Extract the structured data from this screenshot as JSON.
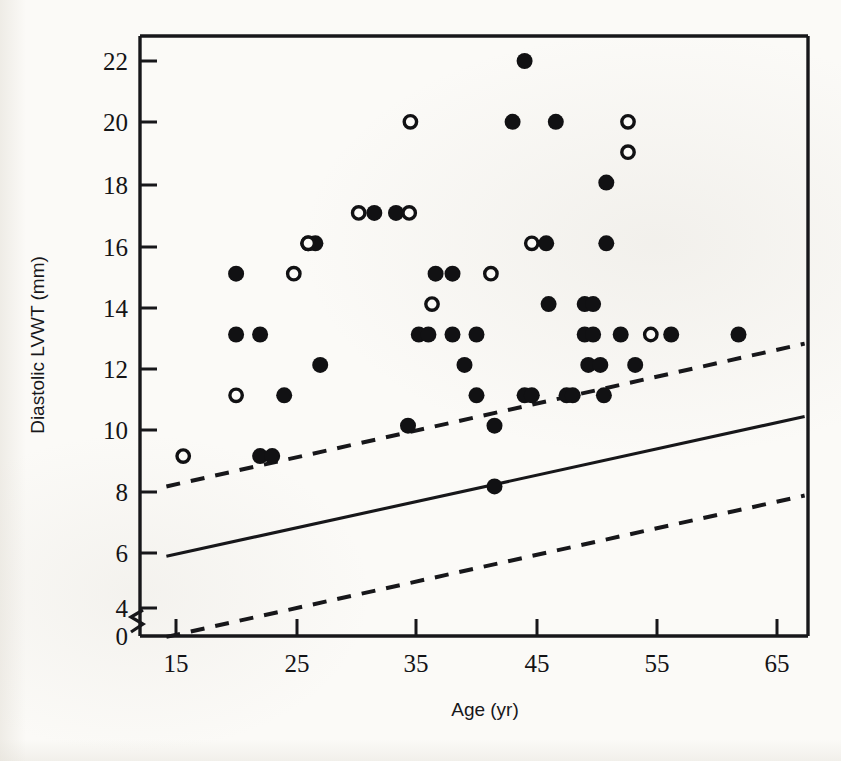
{
  "figure": {
    "background_color": "#fbfaf7",
    "ink_color": "#17171a"
  },
  "axes": {
    "x_label": "Age (yr)",
    "y_label": "Diastolic LVWT (mm)",
    "x_ticks": [
      "15",
      "25",
      "35",
      "45",
      "55",
      "65"
    ],
    "y_ticks": [
      "0",
      "4",
      "6",
      "8",
      "10",
      "12",
      "14",
      "16",
      "18",
      "20",
      "22"
    ],
    "y_axis_break": true
  },
  "chart_data": {
    "type": "scatter",
    "title": "",
    "xlabel": "Age (yr)",
    "ylabel": "Diastolic LVWT (mm)",
    "xlim": [
      13.5,
      67.5
    ],
    "ylim": [
      3.6,
      22.9
    ],
    "y_axis_break_between": [
      0,
      4
    ],
    "grid": false,
    "legend_position": "none",
    "xticks": [
      15,
      25,
      35,
      45,
      55,
      65
    ],
    "yticks": [
      4,
      6,
      8,
      10,
      12,
      14,
      16,
      18,
      20,
      22
    ],
    "series": [
      {
        "name": "filled-circle",
        "marker": "filled circle",
        "color": "#111113",
        "points": [
          [
            20,
            15
          ],
          [
            20,
            13
          ],
          [
            22,
            13
          ],
          [
            22,
            9
          ],
          [
            23,
            9
          ],
          [
            24,
            11
          ],
          [
            26,
            16
          ],
          [
            26.6,
            16
          ],
          [
            27,
            12
          ],
          [
            31.5,
            17
          ],
          [
            33.3,
            17
          ],
          [
            34.3,
            10
          ],
          [
            35.2,
            13
          ],
          [
            36,
            13
          ],
          [
            36.6,
            15
          ],
          [
            38,
            15
          ],
          [
            38,
            13
          ],
          [
            39,
            12
          ],
          [
            40,
            13
          ],
          [
            40,
            11
          ],
          [
            41.5,
            10
          ],
          [
            41.5,
            8
          ],
          [
            43,
            20
          ],
          [
            44,
            22
          ],
          [
            44,
            11
          ],
          [
            44.6,
            11
          ],
          [
            45.8,
            16
          ],
          [
            46,
            14
          ],
          [
            46.6,
            20
          ],
          [
            47.5,
            11
          ],
          [
            48,
            11
          ],
          [
            49,
            13
          ],
          [
            49,
            14
          ],
          [
            49.7,
            14
          ],
          [
            49.7,
            13
          ],
          [
            49.3,
            12
          ],
          [
            50.3,
            12
          ],
          [
            50.6,
            11
          ],
          [
            50.8,
            16
          ],
          [
            50.8,
            18
          ],
          [
            52,
            13
          ],
          [
            53.2,
            12
          ],
          [
            56.2,
            13
          ],
          [
            61.8,
            13
          ]
        ]
      },
      {
        "name": "open-circle",
        "marker": "open circle",
        "color": "#111113",
        "points": [
          [
            15.6,
            9
          ],
          [
            20,
            11
          ],
          [
            24.8,
            15
          ],
          [
            26,
            16
          ],
          [
            30.2,
            17
          ],
          [
            34.4,
            17
          ],
          [
            34.5,
            20
          ],
          [
            36.3,
            14
          ],
          [
            41.2,
            15
          ],
          [
            44.6,
            16
          ],
          [
            52.6,
            20
          ],
          [
            52.6,
            19
          ],
          [
            54.5,
            13
          ]
        ]
      }
    ],
    "lines": [
      {
        "name": "regression-mean",
        "style": "solid",
        "x": [
          14.2,
          67.3
        ],
        "y": [
          5.7,
          10.3
        ]
      },
      {
        "name": "upper-prediction-limit",
        "style": "dashed",
        "x": [
          14.2,
          67.3
        ],
        "y": [
          8.0,
          12.7
        ]
      },
      {
        "name": "lower-prediction-limit",
        "style": "dashed",
        "x": [
          14.2,
          67.3
        ],
        "y": [
          3.05,
          7.7
        ]
      }
    ]
  }
}
